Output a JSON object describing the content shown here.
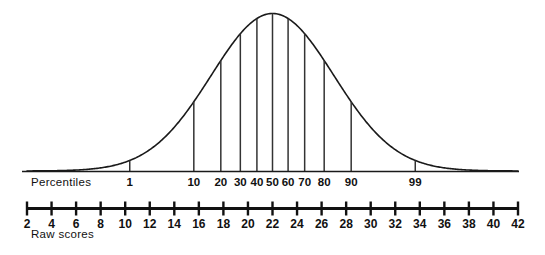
{
  "figure": {
    "title": "",
    "percentile_axis_caption": "Percentiles",
    "raw_axis_caption": "Raw scores"
  },
  "chart_data": {
    "type": "line",
    "title": "",
    "subtitle": "",
    "xlabel": "Raw scores",
    "ylabel": "",
    "grid": false,
    "legend": null,
    "curve": {
      "name": "normal-curve",
      "mean_raw_score": 22,
      "sd_raw_score": 5,
      "x_axis_range": [
        2,
        42
      ],
      "color": "#1a1a1a"
    },
    "percentile_axis": {
      "label": "Percentiles",
      "ticks": [
        1,
        10,
        20,
        30,
        40,
        50,
        60,
        70,
        80,
        90,
        99
      ],
      "tick_labels": [
        "1",
        "10",
        "20",
        "30",
        "40",
        "50",
        "60",
        "70",
        "80",
        "90",
        "99"
      ],
      "raw_score_at_percentile": [
        10.37,
        15.59,
        17.79,
        19.38,
        20.73,
        22.0,
        23.27,
        24.62,
        26.21,
        28.41,
        33.63
      ]
    },
    "raw_score_axis": {
      "label": "Raw scores",
      "ticks": [
        2,
        4,
        6,
        8,
        10,
        12,
        14,
        16,
        18,
        20,
        22,
        24,
        26,
        28,
        30,
        32,
        34,
        36,
        38,
        40,
        42
      ],
      "tick_labels": [
        "2",
        "4",
        "6",
        "8",
        "10",
        "12",
        "14",
        "16",
        "18",
        "20",
        "22",
        "24",
        "26",
        "28",
        "30",
        "32",
        "34",
        "36",
        "38",
        "40",
        "42"
      ],
      "xlim": [
        2,
        42
      ]
    }
  },
  "colors": {
    "ink": "#111111",
    "curve": "#1a1a1a",
    "ordinate": "#333333",
    "background": "#ffffff"
  }
}
